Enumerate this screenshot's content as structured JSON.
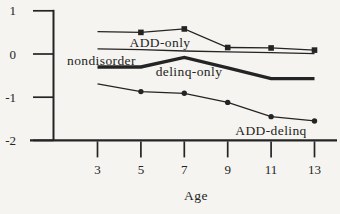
{
  "figure": {
    "background": "#f5f4f0",
    "ink": "#242424"
  },
  "chart_data": {
    "type": "line",
    "title": "",
    "xlabel": "Age",
    "ylabel": "",
    "x": [
      3,
      5,
      7,
      9,
      11,
      13
    ],
    "xticks": [
      3,
      5,
      7,
      9,
      11,
      13
    ],
    "yticks": [
      1,
      0,
      -1,
      -2
    ],
    "xlim": [
      3,
      13
    ],
    "ylim": [
      -2,
      1
    ],
    "grid": false,
    "legend": "inline-labels",
    "series": [
      {
        "name": "ADD-only",
        "values": [
          0.52,
          0.5,
          0.58,
          0.15,
          0.14,
          0.09
        ],
        "marker": "square",
        "markers_at": [
          5,
          7,
          9,
          11,
          13
        ],
        "line": "thin",
        "label": {
          "text": "ADD-only",
          "x": 160,
          "y": 46.5,
          "anchor": "middle"
        }
      },
      {
        "name": "nondisorder",
        "values": [
          0.12,
          0.1,
          0.07,
          0.05,
          0.03,
          0.01
        ],
        "marker": "none",
        "markers_at": [],
        "line": "thin",
        "label": {
          "text": "nondisorder",
          "x": 67,
          "y": 64.5,
          "anchor": "start"
        }
      },
      {
        "name": "delinq-only",
        "values": [
          -0.3,
          -0.3,
          -0.08,
          -0.32,
          -0.57,
          -0.57
        ],
        "marker": "none",
        "markers_at": [],
        "line": "thick",
        "label": {
          "text": "delinq-only",
          "x": 189,
          "y": 75.5,
          "anchor": "middle"
        }
      },
      {
        "name": "ADD-delinq",
        "values": [
          -0.69,
          -0.87,
          -0.91,
          -1.12,
          -1.45,
          -1.55
        ],
        "marker": "dot",
        "markers_at": [
          5,
          7,
          9,
          11,
          13
        ],
        "line": "thin",
        "label": {
          "text": "ADD-delinq",
          "x": 271,
          "y": 134.5,
          "anchor": "middle"
        }
      }
    ]
  }
}
